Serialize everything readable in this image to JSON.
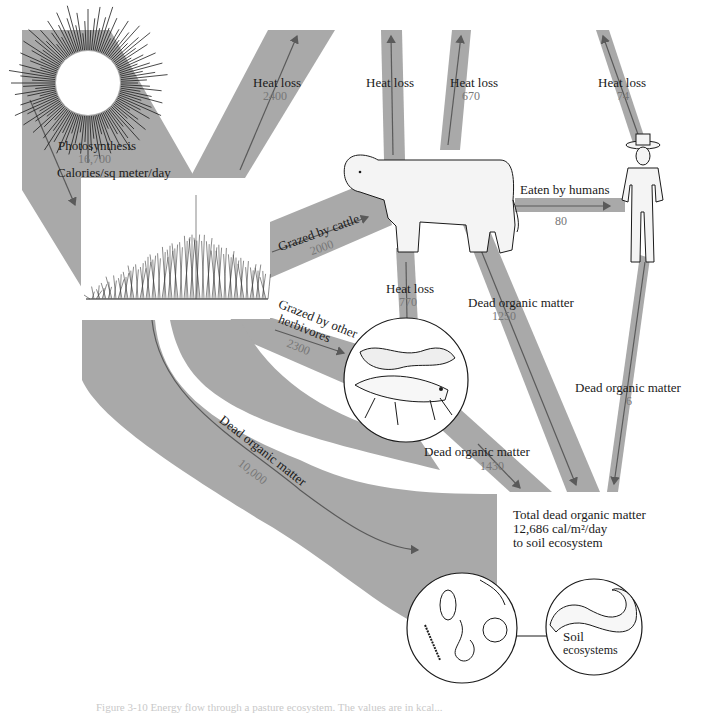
{
  "colors": {
    "flow_band": "#a9a9a9",
    "arrow": "#5a5a5a",
    "label_text": "#1a1a1a",
    "value_text": "#777777",
    "background": "#ffffff"
  },
  "source": {
    "label": "Photosynthesis",
    "value": "16,700",
    "unit": "Calories/sq meter/day"
  },
  "flows": {
    "producer_heat_loss": {
      "label": "Heat loss",
      "value": "2400"
    },
    "cattle_heat_loss_top": {
      "label": "Heat loss"
    },
    "herbivore_heat_loss": {
      "label": "Heat loss",
      "value": "670"
    },
    "human_heat_loss": {
      "label": "Heat loss",
      "value": "74"
    },
    "grazed_by_cattle": {
      "label": "Grazed by cattle",
      "value": "2000"
    },
    "eaten_by_humans": {
      "label": "Eaten by humans",
      "value": "80"
    },
    "cattle_heat_loss": {
      "label": "Heat loss",
      "value": "770"
    },
    "cattle_dead_matter": {
      "label": "Dead organic matter",
      "value": "1250"
    },
    "grazed_by_other_herbivores": {
      "label_line1": "Grazed by other",
      "label_line2": "herbivores",
      "value": "2300"
    },
    "human_dead_matter": {
      "label": "Dead organic matter",
      "value": "6"
    },
    "herbivore_dead_matter": {
      "label": "Dead organic matter",
      "value": "1430"
    },
    "producer_dead_matter": {
      "label": "Dead organic matter",
      "value": "10,000"
    }
  },
  "sink": {
    "line1": "Total dead organic matter",
    "line2": "12,686 cal/m²/day",
    "line3": "to soil ecosystem"
  },
  "soil": {
    "label_line1": "Soil",
    "label_line2": "ecosystems"
  },
  "illustrations": {
    "sun": "sun-illustration",
    "grass": "grassland-illustration",
    "cow": "cattle-illustration",
    "human": "human-illustration",
    "insects": "caterpillar-grasshopper-illustration",
    "soil_fauna": "soil-invertebrates-illustration",
    "worm": "earthworm-illustration"
  },
  "caption": "Figure 3-10  Energy flow through a pasture ecosystem. The values are in kcal..."
}
